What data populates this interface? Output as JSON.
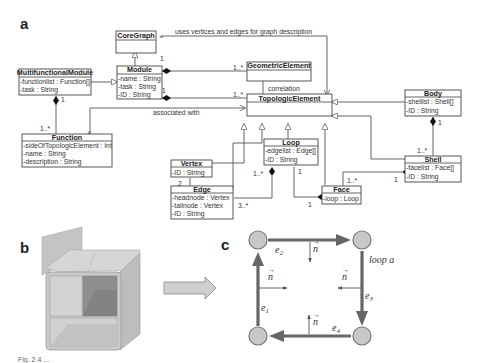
{
  "figure": {
    "panels": {
      "a": "a",
      "b": "b",
      "c": "c"
    },
    "caption_fragment": "Fig. 2.4 ..."
  },
  "uml": {
    "classes": {
      "coregraph": {
        "name": "CoreGraph",
        "attrs": []
      },
      "module": {
        "name": "Module",
        "attrs": [
          "-name : String",
          "-task : String",
          "-ID : String"
        ]
      },
      "multifunctional": {
        "name": "MultifunctionalModule",
        "attrs": [
          "-functionlist : Function[]",
          "-task : String"
        ]
      },
      "function": {
        "name": "Function",
        "attrs": [
          "-sideOfTopologicElement : Int",
          "-name : String",
          "-description : String"
        ]
      },
      "geometric": {
        "name": "GeometricElement",
        "attrs": []
      },
      "topologic": {
        "name": "TopologicElement",
        "attrs": []
      },
      "body": {
        "name": "Body",
        "attrs": [
          "-shellist : Shell[]",
          "-ID : String"
        ]
      },
      "vertex": {
        "name": "Vertex",
        "attrs": [
          "-ID : String"
        ]
      },
      "loop": {
        "name": "Loop",
        "attrs": [
          "-edgelist : Edge[]",
          "-ID : String"
        ]
      },
      "edge": {
        "name": "Edge",
        "attrs": [
          "-headnode : Vertex",
          "-tailnode : Vertex",
          "-ID : String"
        ]
      },
      "face": {
        "name": "Face",
        "attrs": [
          "-loop : Loop"
        ]
      },
      "shell": {
        "name": "Shell",
        "attrs": [
          "-facelist : Face[]",
          "-ID : String"
        ]
      }
    },
    "associations": {
      "uses": "uses vertices and edges for graph description",
      "correlation": "correlation",
      "associated": "associated with"
    },
    "multiplicities": {
      "module_core": "1",
      "module_geo_1": "1..*",
      "module_topo_1": "1",
      "module_topo_n": "1..*",
      "mfm_1": "1",
      "func_n": "1..*",
      "vertex_2": "2",
      "edge_n": "1..*",
      "loop_n": "1..*",
      "edge_3": "3..*",
      "loop_1": "1",
      "face_1": "1",
      "face_n": "1..*",
      "shell_1": "1",
      "body_1": "1",
      "shell_n": "1..*"
    }
  },
  "loop_graph": {
    "label": "loop a",
    "edges": [
      {
        "name": "e",
        "sub": "1"
      },
      {
        "name": "e",
        "sub": "2"
      },
      {
        "name": "e",
        "sub": "3"
      },
      {
        "name": "e",
        "sub": "4"
      }
    ],
    "normal": "n",
    "colors": {
      "edge": "#666666",
      "node_fill": "#c8c8c8",
      "node_stroke": "#777777"
    }
  },
  "solid_model": {
    "colors": {
      "light": "#d0d0d0",
      "mid": "#b8b8b8",
      "dark": "#8c8c8c",
      "arrow": "#cfcfcf"
    }
  }
}
